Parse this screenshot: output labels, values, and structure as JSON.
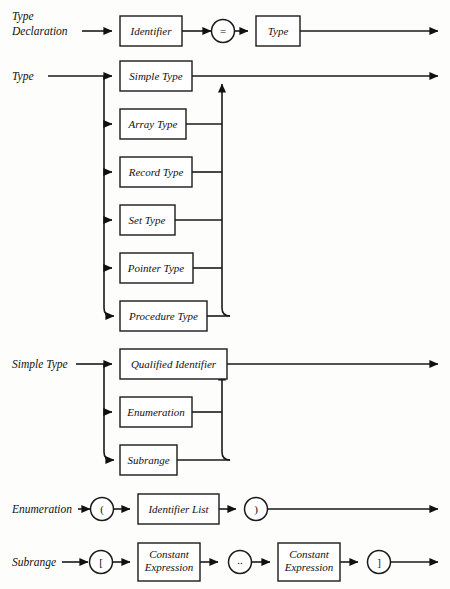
{
  "diagram": {
    "style": "railroad-syntax-diagram",
    "ink_color": "#1a1a1a",
    "background_color": "#fdfdfb",
    "productions": [
      {
        "id": "type-declaration",
        "label": "Type\nDeclaration",
        "label_lines": [
          "Type",
          "Declaration"
        ],
        "sequence": [
          {
            "kind": "box",
            "text": "Identifier"
          },
          {
            "kind": "circle",
            "text": "="
          },
          {
            "kind": "box",
            "text": "Type"
          }
        ]
      },
      {
        "id": "type",
        "label": "Type",
        "label_lines": [
          "Type"
        ],
        "alternatives": [
          {
            "kind": "box",
            "text": "Simple Type"
          },
          {
            "kind": "box",
            "text": "Array Type"
          },
          {
            "kind": "box",
            "text": "Record Type"
          },
          {
            "kind": "box",
            "text": "Set Type"
          },
          {
            "kind": "box",
            "text": "Pointer Type"
          },
          {
            "kind": "box",
            "text": "Procedure Type"
          }
        ]
      },
      {
        "id": "simple-type",
        "label": "Simple Type",
        "label_lines": [
          "Simple Type"
        ],
        "alternatives": [
          {
            "kind": "box",
            "text": "Qualified Identifier"
          },
          {
            "kind": "box",
            "text": "Enumeration"
          },
          {
            "kind": "box",
            "text": "Subrange"
          }
        ]
      },
      {
        "id": "enumeration",
        "label": "Enumeration",
        "label_lines": [
          "Enumeration"
        ],
        "sequence": [
          {
            "kind": "circle",
            "text": "("
          },
          {
            "kind": "box",
            "text": "Identifier List"
          },
          {
            "kind": "circle",
            "text": ")"
          }
        ]
      },
      {
        "id": "subrange",
        "label": "Subrange",
        "label_lines": [
          "Subrange"
        ],
        "sequence": [
          {
            "kind": "circle",
            "text": "["
          },
          {
            "kind": "box",
            "text": "Constant Expression",
            "text_lines": [
              "Constant",
              "Expression"
            ]
          },
          {
            "kind": "circle",
            "text": ".."
          },
          {
            "kind": "box",
            "text": "Constant Expression",
            "text_lines": [
              "Constant",
              "Expression"
            ]
          },
          {
            "kind": "circle",
            "text": "]"
          }
        ]
      }
    ]
  }
}
